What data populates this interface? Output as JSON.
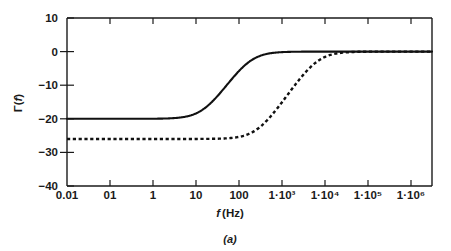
{
  "figure": {
    "caption": "(a)",
    "xlabel_italic": "f",
    "xlabel_rest": "(Hz)",
    "ylabel": "Γ(f)"
  },
  "chart_data": {
    "type": "line",
    "title": "",
    "subtitle": "",
    "caption": "(a)",
    "xlabel": "f (Hz)",
    "ylabel": "Γ(f)",
    "xscale": "log",
    "xlim": [
      0.01,
      1000000
    ],
    "ylim": [
      -40,
      10
    ],
    "yticks": [
      10,
      0,
      -10,
      -20,
      -30,
      -40
    ],
    "ytick_labels": [
      "10",
      "0",
      "-10",
      "-20",
      "-30",
      "-40"
    ],
    "xticks": [
      0.01,
      0.1,
      1,
      10,
      100,
      1000,
      10000,
      100000,
      1000000
    ],
    "xtick_labels": [
      "0.01",
      "01",
      "1",
      "10",
      "100",
      "1·10³",
      "1·10⁴",
      "1·10⁵",
      "1·10⁶"
    ],
    "grid": false,
    "legend": "none",
    "series": [
      {
        "name": "solid-curve",
        "style": "solid",
        "low_plateau_db": -20,
        "high_plateau_db": 0,
        "corner_hz": 100,
        "x": [
          0.01,
          0.1,
          1,
          3,
          10,
          20,
          30,
          50,
          70,
          100,
          150,
          200,
          300,
          500,
          700,
          1000,
          3000,
          10000,
          100000,
          1000000
        ],
        "y": [
          -20,
          -20,
          -20,
          -20,
          -19.9,
          -19.3,
          -18.3,
          -15.6,
          -13.2,
          -10.3,
          -6.8,
          -4.8,
          -2.7,
          -1.1,
          -0.6,
          -0.3,
          -0.05,
          0,
          0,
          0
        ]
      },
      {
        "name": "dashed-curve",
        "style": "dashed",
        "low_plateau_db": -26,
        "high_plateau_db": 0,
        "corner_hz": 3000,
        "x": [
          0.01,
          0.1,
          1,
          10,
          100,
          300,
          1000,
          1500,
          2000,
          3000,
          5000,
          7000,
          10000,
          15000,
          20000,
          30000,
          50000,
          100000,
          1000000
        ],
        "y": [
          -26,
          -26,
          -26,
          -26,
          -26,
          -25.9,
          -25.1,
          -24.0,
          -22.5,
          -19.0,
          -14.0,
          -10.8,
          -7.6,
          -4.9,
          -3.5,
          -2.0,
          -0.9,
          -0.25,
          0
        ]
      }
    ],
    "tick_labels_yaxis_display": [
      "10",
      "0",
      "−10",
      "−20",
      "−30",
      "−40"
    ],
    "xtick_positions_px": [
      67,
      110,
      153,
      196,
      239,
      282,
      325,
      368,
      411
    ],
    "ytick_positions_px": [
      18,
      51.6,
      85.2,
      118.8,
      152.4,
      186
    ]
  }
}
